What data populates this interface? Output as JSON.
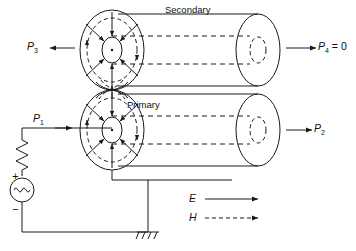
{
  "figure": {
    "type": "schematic-diagram",
    "background_color": "#ffffff",
    "line_color": "#1a1a1a"
  },
  "labels": {
    "secondary": "Secondary",
    "primary": "Primary",
    "p1": "P",
    "p1_sub": "1",
    "p2": "P",
    "p2_sub": "2",
    "p3": "P",
    "p3_sub": "3",
    "p4": "P",
    "p4_sub": "4",
    "p4_value": " = 0"
  },
  "legend": {
    "e_label": "E",
    "e_style": "solid-arrow",
    "h_label": "H",
    "h_style": "dashed-arrow"
  },
  "circuit": {
    "source_type": "ac-sine-source",
    "source_plus": "+",
    "source_minus": "−",
    "resistor": "zigzag-resistor",
    "ground": "earth-ground"
  },
  "ports": [
    {
      "name": "P1",
      "direction": "right",
      "location": "primary-left-input"
    },
    {
      "name": "P2",
      "direction": "right",
      "location": "primary-right-output"
    },
    {
      "name": "P3",
      "direction": "left",
      "location": "secondary-left-output"
    },
    {
      "name": "P4",
      "direction": "right",
      "location": "secondary-right-output",
      "value": "0"
    }
  ]
}
